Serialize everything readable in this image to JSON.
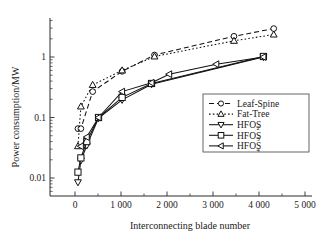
{
  "chart_data": {
    "type": "line",
    "title": "",
    "xlabel": "Interconnecting blade number",
    "ylabel": "Power consumption/MW",
    "yscale": "log",
    "xlim": [
      -250,
      5250
    ],
    "ylim": [
      0.006,
      4.2
    ],
    "xticks": [
      0,
      1000,
      2000,
      3000,
      4000,
      5000
    ],
    "xticklabels": [
      "0",
      "1 000",
      "2 000",
      "3 000",
      "4 000",
      "5 000"
    ],
    "yticks": [
      0.01,
      0.1,
      1
    ],
    "yticklabels": [
      "0.01",
      "0.1",
      "1"
    ],
    "grid": false,
    "legend_position": "right-middle",
    "series": [
      {
        "name": "Leaf-Spine",
        "marker": "circle",
        "linestyle": "dashed",
        "x": [
          64,
          128,
          384,
          1024,
          1728,
          3456,
          4320
        ],
        "y": [
          0.0655,
          0.0655,
          0.268,
          0.58,
          1.08,
          2.2,
          2.95
        ]
      },
      {
        "name": "Fat-Tree",
        "marker": "triangle-up",
        "linestyle": "dotted",
        "x": [
          64,
          128,
          384,
          1024,
          1728,
          3456,
          4320
        ],
        "y": [
          0.0335,
          0.152,
          0.345,
          0.6,
          1.02,
          1.85,
          2.35
        ]
      },
      {
        "name": "HFOS2",
        "label_base": "HFOS",
        "label_sub": "2",
        "marker": "triangle-down",
        "linestyle": "solid",
        "x": [
          64,
          128,
          256,
          512,
          1024,
          1664,
          4096
        ],
        "y": [
          0.0085,
          0.0195,
          0.0345,
          0.098,
          0.196,
          0.355,
          1.0
        ]
      },
      {
        "name": "HFOS3",
        "label_base": "HFOS",
        "label_sub": "3",
        "marker": "square",
        "linestyle": "solid",
        "x": [
          64,
          128,
          256,
          512,
          1024,
          1664,
          4096
        ],
        "y": [
          0.0125,
          0.0215,
          0.04,
          0.1,
          0.215,
          0.365,
          1.02
        ]
      },
      {
        "name": "HFOS4",
        "label_base": "HFOS",
        "label_sub": "4",
        "marker": "triangle-left",
        "linestyle": "solid",
        "x": [
          128,
          256,
          512,
          1024,
          1664,
          2048,
          3072,
          4096
        ],
        "y": [
          0.0335,
          0.0475,
          0.1,
          0.268,
          0.375,
          0.52,
          0.76,
          1.0
        ]
      }
    ]
  },
  "legend": {
    "entries": [
      {
        "label": "Leaf-Spine",
        "sub": ""
      },
      {
        "label": "Fat-Tree",
        "sub": ""
      },
      {
        "label": "HFOS",
        "sub": "2"
      },
      {
        "label": "HFOS",
        "sub": "3"
      },
      {
        "label": "HFOS",
        "sub": "4"
      }
    ]
  },
  "colors": {
    "axis": "#2a2a2a",
    "series": "#111111",
    "background": "#ffffff",
    "legend_border": "#555555"
  }
}
